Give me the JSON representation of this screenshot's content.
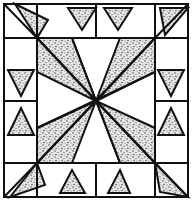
{
  "diagram": {
    "type": "quilt-block-pattern",
    "colors": {
      "line": "#111111",
      "background": "#ffffff",
      "stipple": "#333333"
    },
    "frame": {
      "x": 4,
      "y": 4,
      "w": 184,
      "h": 193
    },
    "inner": {
      "x1": 37,
      "y1": 38,
      "x2": 155,
      "y2": 163
    },
    "center": {
      "x": 96,
      "y": 101
    }
  }
}
